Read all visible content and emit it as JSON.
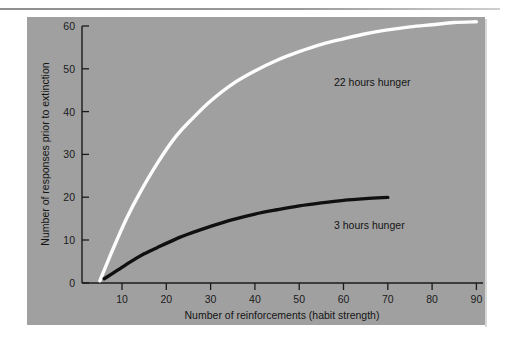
{
  "figure": {
    "background_color": "#ffffff",
    "panel_color": "#a0a0a0",
    "rule_color": "#9a9a9a"
  },
  "chart_data": {
    "type": "line",
    "title": "",
    "xlabel": "Number of reinforcements (habit strength)",
    "ylabel": "Number of responses prior to extinction",
    "xlim": [
      1,
      92
    ],
    "ylim": [
      0,
      62
    ],
    "xticks": [
      10,
      20,
      30,
      40,
      50,
      60,
      70,
      80,
      90
    ],
    "yticks": [
      0,
      10,
      20,
      30,
      40,
      50,
      60
    ],
    "grid": false,
    "legend_position": "inline-annotations",
    "series": [
      {
        "name": "22 hours hunger",
        "color": "#fdfdfd",
        "annotation": "22 hours hunger",
        "x": [
          5,
          8,
          11,
          14,
          18,
          22,
          26,
          30,
          35,
          40,
          45,
          50,
          55,
          60,
          65,
          70,
          75,
          80,
          85,
          90
        ],
        "y": [
          0.5,
          8,
          15,
          21,
          28,
          34,
          38.5,
          42.5,
          46.5,
          49.5,
          52,
          54,
          55.7,
          57,
          58.2,
          59.1,
          59.8,
          60.3,
          60.8,
          61
        ]
      },
      {
        "name": "3 hours hunger",
        "color": "#101010",
        "annotation": "3 hours hunger",
        "x": [
          6,
          9,
          12,
          15,
          18,
          22,
          26,
          30,
          35,
          40,
          45,
          50,
          55,
          60,
          65,
          70
        ],
        "y": [
          1,
          3,
          5,
          6.8,
          8.3,
          10.2,
          11.8,
          13.2,
          14.8,
          16.1,
          17.1,
          18,
          18.7,
          19.3,
          19.7,
          20
        ]
      }
    ]
  }
}
